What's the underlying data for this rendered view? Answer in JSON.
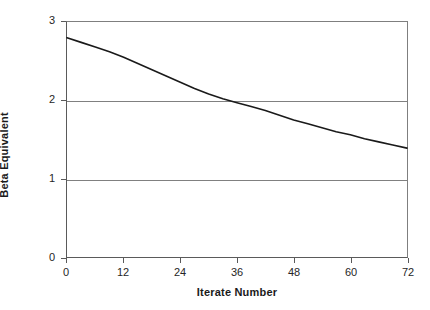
{
  "chart_data": {
    "type": "line",
    "title": "",
    "xlabel": "Iterate Number",
    "ylabel": "Beta Equivalent",
    "xlim": [
      0,
      72
    ],
    "ylim": [
      0,
      3
    ],
    "xticks": [
      0,
      12,
      24,
      36,
      48,
      60,
      72
    ],
    "yticks": [
      0,
      1,
      2,
      3
    ],
    "xtick_labels": [
      "0",
      "12",
      "24",
      "36",
      "48",
      "60",
      "72"
    ],
    "ytick_labels": [
      "0",
      "1",
      "2",
      "3"
    ],
    "grid": "horizontal",
    "legend": "none",
    "series": [
      {
        "name": "Beta Equivalent",
        "color": "#1a1a1a",
        "x": [
          0,
          3,
          6,
          9,
          12,
          15,
          18,
          21,
          24,
          27,
          30,
          33,
          36,
          39,
          42,
          45,
          48,
          51,
          54,
          57,
          60,
          63,
          66,
          69,
          72
        ],
        "y": [
          2.8,
          2.74,
          2.68,
          2.62,
          2.55,
          2.47,
          2.39,
          2.31,
          2.23,
          2.15,
          2.08,
          2.02,
          1.97,
          1.92,
          1.87,
          1.81,
          1.75,
          1.7,
          1.65,
          1.6,
          1.56,
          1.51,
          1.47,
          1.43,
          1.39
        ]
      }
    ]
  },
  "axes": {
    "y_title": "Beta Equivalent",
    "x_title": "Iterate Number"
  }
}
